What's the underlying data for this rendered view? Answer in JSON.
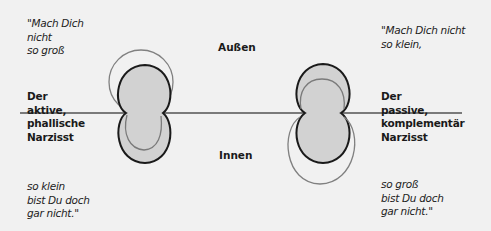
{
  "diagram": {
    "labels": {
      "outside": "Außen",
      "inside": "Innen"
    },
    "left": {
      "quote_top": [
        "\"Mach Dich",
        "nicht",
        "so groß"
      ],
      "title": [
        "Der",
        "aktive,",
        "phallische",
        "Narzisst"
      ],
      "quote_bottom": [
        "so klein",
        "bist Du doch",
        "gar nicht.\""
      ]
    },
    "right": {
      "quote_top": [
        "\"Mach Dich nicht",
        "so klein,"
      ],
      "title": [
        "Der",
        "passive,",
        "komplementär",
        "Narzisst"
      ],
      "quote_bottom": [
        "so groß",
        "bist Du doch",
        "gar nicht.\""
      ]
    },
    "colors": {
      "background": "#f1f1f1",
      "fill": "#d2d2d2",
      "outline": "#1a1a1a",
      "thin_outline": "#777777",
      "baseline": "#777777"
    }
  }
}
